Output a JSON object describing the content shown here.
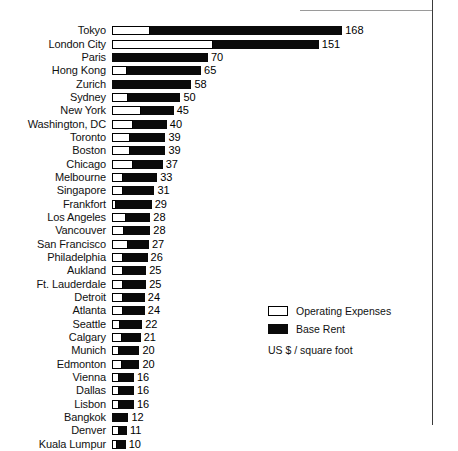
{
  "chart_data": {
    "type": "bar",
    "orientation": "horizontal",
    "stacked": true,
    "title": "",
    "xlabel": "",
    "ylabel": "",
    "unit_note": "US $  / square foot",
    "grid": false,
    "axis_visible": false,
    "legend_position": "bottom-right",
    "xlim": [
      0,
      168
    ],
    "categories": [
      "Tokyo",
      "London City",
      "Paris",
      "Hong Kong",
      "Zurich",
      "Sydney",
      "New York",
      "Washington, DC",
      "Toronto",
      "Boston",
      "Chicago",
      "Melbourne",
      "Singapore",
      "Frankfort",
      "Los Angeles",
      "Vancouver",
      "San Francisco",
      "Philadelphia",
      "Aukland",
      "Ft. Lauderdale",
      "Detroit",
      "Atlanta",
      "Seattle",
      "Calgary",
      "Munich",
      "Edmonton",
      "Vienna",
      "Dallas",
      "Lisbon",
      "Bangkok",
      "Denver",
      "Kuala Lumpur"
    ],
    "values": [
      168,
      151,
      70,
      65,
      58,
      50,
      45,
      40,
      39,
      39,
      37,
      33,
      31,
      29,
      28,
      28,
      27,
      26,
      25,
      25,
      24,
      24,
      22,
      21,
      20,
      20,
      16,
      16,
      16,
      12,
      11,
      10
    ],
    "series": [
      {
        "name": "Operating Expenses",
        "color": "#ffffff",
        "values": [
          28,
          74,
          0,
          11,
          0,
          12,
          21,
          15,
          13,
          13,
          15,
          8,
          8,
          3,
          10,
          9,
          12,
          8,
          8,
          8,
          8,
          8,
          6,
          7,
          5,
          7,
          5,
          5,
          5,
          0,
          5,
          4
        ]
      },
      {
        "name": "Base Rent",
        "color": "#0a0a0a",
        "values": [
          140,
          77,
          70,
          54,
          58,
          38,
          24,
          25,
          26,
          26,
          22,
          25,
          23,
          26,
          18,
          19,
          15,
          18,
          17,
          17,
          16,
          16,
          16,
          14,
          15,
          13,
          11,
          11,
          11,
          12,
          6,
          6
        ]
      }
    ],
    "value_labels": [
      "168",
      "151",
      "70",
      "65",
      "58",
      "50",
      "45",
      "40",
      "39",
      "39",
      "37",
      "33",
      "31",
      "29",
      "28",
      "28",
      "27",
      "26",
      "25",
      "25",
      "24",
      "24",
      "22",
      "21",
      "20",
      "20",
      "16",
      "16",
      "16",
      "12",
      "11",
      "10"
    ]
  },
  "legend": {
    "items": [
      {
        "label": "Operating Expenses",
        "swatch": "white-outlined-square"
      },
      {
        "label": "Base Rent",
        "swatch": "black-filled-square"
      }
    ],
    "unit": "US $  / square foot"
  }
}
